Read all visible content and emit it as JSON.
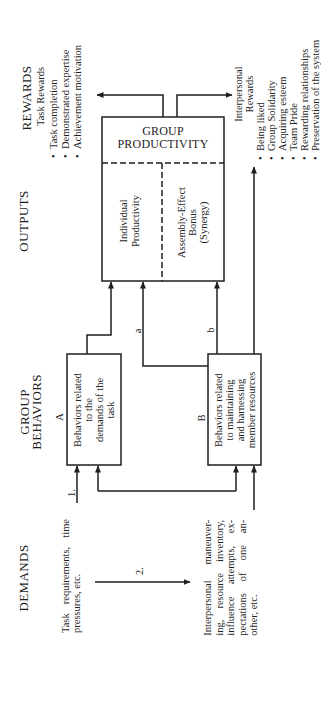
{
  "columns": {
    "rewards": "REWARDS",
    "outputs": "OUTPUTS",
    "group_behaviors": [
      "GROUP",
      "BEHAVIORS"
    ],
    "demands": "DEMANDS"
  },
  "bullet": "•",
  "rewards": {
    "task": {
      "title": "Task Rewards",
      "items": [
        "Task completion",
        "Demonstrated expertise",
        "Achievement motivation"
      ]
    },
    "interpersonal": {
      "title": [
        "Interpersonal",
        "Rewards"
      ],
      "items": [
        "Being liked",
        "Group Solidarity",
        "Acquiring esteem",
        "Team Pride",
        "Rewarding relationships",
        "Preservation of the system"
      ]
    }
  },
  "outputs": {
    "title": [
      "GROUP",
      "PRODUCTIVITY"
    ],
    "individual": [
      "Individual",
      "Productivity"
    ],
    "assembly": [
      "Assembly-Effect",
      "Bonus",
      "(Synergy)"
    ]
  },
  "behaviors": {
    "a": {
      "label": "A",
      "text": [
        "Behaviors related",
        "to the",
        "demands of the",
        "task"
      ]
    },
    "b": {
      "label": "B",
      "text": [
        "Behaviors related",
        "to maintaining",
        "and harnessing",
        "member resources"
      ]
    }
  },
  "demands": {
    "task": [
      "Task requirements, time",
      "pressures, etc."
    ],
    "interpersonal": [
      "Interpersonal maneuver-",
      "ing, resource inventory,",
      "influence attempts, ex-",
      "pectations of one an-",
      "other, etc."
    ]
  },
  "edge_labels": {
    "one": "1.",
    "two": "2.",
    "a": "a",
    "b": "b"
  },
  "edges": [
    {
      "from": "Task requirements, time pressures, etc.",
      "to": "A",
      "label": "1."
    },
    {
      "from": "Task requirements, time pressures, etc.",
      "to": "Interpersonal maneuvering, resource inventory, influence attempts, expectations of one another, etc.",
      "label": "2."
    },
    {
      "from": "Interpersonal maneuvering, resource inventory, influence attempts, expectations of one another, etc.",
      "to": "B",
      "label": ""
    },
    {
      "from": "A",
      "to": "B",
      "label": "",
      "bidirectional": true
    },
    {
      "from": "A",
      "to": "Individual Productivity",
      "label": ""
    },
    {
      "from": "B",
      "to": "Individual Productivity",
      "label": "a"
    },
    {
      "from": "B",
      "to": "Assembly-Effect Bonus (Synergy)",
      "label": "b"
    },
    {
      "from": "B",
      "to": "Interpersonal Rewards",
      "label": ""
    },
    {
      "from": "GROUP PRODUCTIVITY",
      "to": "Task Rewards",
      "label": ""
    },
    {
      "from": "GROUP PRODUCTIVITY",
      "to": "Interpersonal Rewards",
      "label": ""
    }
  ],
  "colors": {
    "ink": "#1e1e1e",
    "background": "#ffffff"
  }
}
